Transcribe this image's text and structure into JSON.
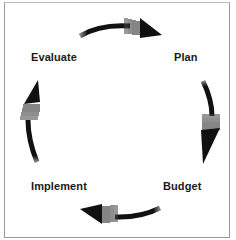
{
  "diagram": {
    "type": "cycle",
    "nodes": [
      {
        "id": "plan",
        "label": "Plan"
      },
      {
        "id": "budget",
        "label": "Budget"
      },
      {
        "id": "implement",
        "label": "Implement"
      },
      {
        "id": "evaluate",
        "label": "Evaluate"
      }
    ],
    "edges": [
      {
        "from": "evaluate",
        "to": "plan"
      },
      {
        "from": "plan",
        "to": "budget"
      },
      {
        "from": "budget",
        "to": "implement"
      },
      {
        "from": "implement",
        "to": "evaluate"
      }
    ],
    "colors": {
      "arrow": "#111111",
      "arrow_tail": "#8a8a8a",
      "text": "#1a1a1a",
      "border": "#9a9a9a"
    }
  }
}
